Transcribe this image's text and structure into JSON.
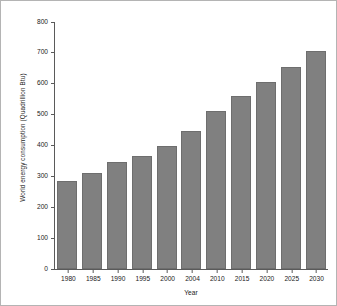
{
  "chart_data": {
    "type": "bar",
    "title": "",
    "xlabel": "Year",
    "ylabel": "World energy consumption (Quadrillion Btu)",
    "categories": [
      "1980",
      "1985",
      "1990",
      "1995",
      "2000",
      "2004",
      "2010",
      "2015",
      "2020",
      "2025",
      "2030"
    ],
    "values": [
      284,
      310,
      347,
      367,
      399,
      447,
      511,
      559,
      606,
      655,
      705
    ],
    "ylim": [
      0,
      800
    ],
    "yticks": [
      0,
      100,
      200,
      300,
      400,
      500,
      600,
      700,
      800
    ],
    "ytick_labels": [
      "0",
      "100",
      "200",
      "300",
      "400",
      "500",
      "600",
      "700",
      "800"
    ],
    "grid": false,
    "legend": null,
    "bar_color": "#808080",
    "bar_edge_color": "#6e6e6e",
    "axis_color": "#5a5a5a",
    "background": "#ffffff"
  }
}
